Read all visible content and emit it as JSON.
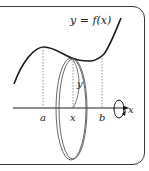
{
  "diagram": {
    "curve_label": "y = f(x)",
    "radius_label": "y",
    "axis_label": "x",
    "ticks": [
      {
        "label": "a",
        "x": 43
      },
      {
        "label": "x",
        "x": 73
      },
      {
        "label": "b",
        "x": 102
      }
    ],
    "colors": {
      "stroke": "#1a1a1a",
      "disk": "#555555",
      "frame": "#3a3a3a",
      "dashed": "#777777"
    }
  }
}
